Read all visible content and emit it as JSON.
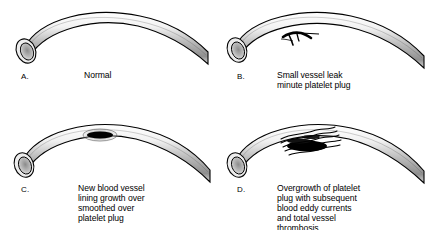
{
  "figure": {
    "background_color": "#ffffff",
    "ink_color": "#000000",
    "panels": [
      {
        "letter": "A.",
        "caption": "Normal",
        "vessel_state": "normal-open-vessel",
        "lesion": "none"
      },
      {
        "letter": "B.",
        "caption": "Small vessel leak\nminute platelet plug",
        "vessel_state": "vessel-with-small-leak",
        "lesion": "minute-platelet-plug"
      },
      {
        "letter": "C.",
        "caption": "New blood vessel\nlining growth over\nsmoothed over\nplatelet plug",
        "vessel_state": "vessel-with-healed-lining",
        "lesion": "smoothed-platelet-plug"
      },
      {
        "letter": "D.",
        "caption": "Overgrowth of platelet\nplug with subsequent\nblood eddy currents\nand total vessel\nthrombosis",
        "vessel_state": "vessel-with-thrombosis",
        "lesion": "overgrown-platelet-plug-with-eddy-currents"
      }
    ]
  }
}
